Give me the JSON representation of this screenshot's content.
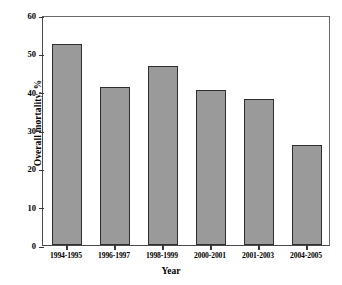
{
  "chart_data": {
    "type": "bar",
    "title": "",
    "xlabel": "Year",
    "ylabel": "Overall mortality, %",
    "categories": [
      "1994-1995",
      "1996-1997",
      "1998-1999",
      "2000-2001",
      "2001-2003",
      "2004-2005"
    ],
    "values": [
      52.5,
      41.2,
      46.8,
      40.5,
      38.0,
      26.0
    ],
    "ylim": [
      0,
      60
    ],
    "yticks": [
      0,
      10,
      20,
      30,
      40,
      50,
      60
    ],
    "ytick_labels": [
      "0",
      "10",
      "20",
      "30",
      "40",
      "50",
      "60"
    ],
    "grid": false,
    "legend": "none",
    "bar_fill_color": "#9a9a9a",
    "bar_edge_color": "#2f2f2f",
    "axis_color": "#4a4a4a",
    "background_color": "#ffffff"
  }
}
